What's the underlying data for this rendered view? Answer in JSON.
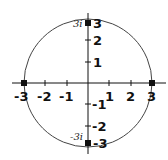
{
  "diagram": {
    "title": "",
    "type": "complex-plane-circle",
    "circle": {
      "center": [
        0,
        0
      ],
      "radius": 3
    },
    "colors": {
      "axis": "#111111",
      "circle": "#444444",
      "point": "#111111"
    },
    "x_ticks": [
      "-3",
      "-2",
      "-1",
      "1",
      "2",
      "3"
    ],
    "y_ticks": [
      "3",
      "2",
      "1",
      "-1",
      "-2",
      "-3"
    ],
    "points": [
      {
        "coord": [
          3,
          0
        ],
        "label": ""
      },
      {
        "coord": [
          -3,
          0
        ],
        "label": ""
      },
      {
        "coord": [
          0,
          3
        ],
        "label": "3i"
      },
      {
        "coord": [
          0,
          -3
        ],
        "label": "-3i"
      }
    ]
  }
}
